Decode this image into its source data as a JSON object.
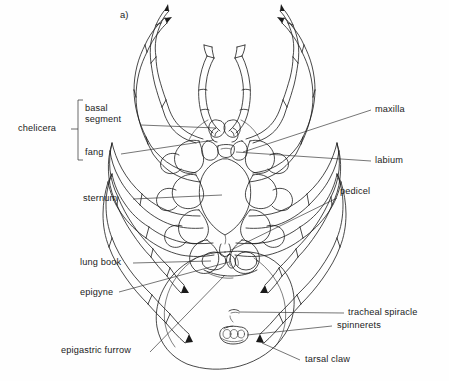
{
  "figure": {
    "tag": "a)",
    "view": "ventral",
    "line_color": "#1a1a1a",
    "background_color": "#fefefe"
  },
  "labels": {
    "chelicera": "chelicera",
    "basal_segment_line1": "basal",
    "basal_segment_line2": "segment",
    "fang": "fang",
    "sternum": "sternum",
    "lung_book": "lung book",
    "epigyne": "epigyne",
    "epigastric_furrow": "epigastric furrow",
    "maxilla": "maxilla",
    "labium": "labium",
    "pedicel": "pedicel",
    "tracheal_spiracle": "tracheal spiracle",
    "spinnerets": "spinnerets",
    "tarsal_claw": "tarsal claw"
  }
}
